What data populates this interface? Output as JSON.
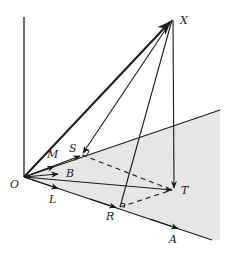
{
  "figure": {
    "colors": {
      "ink": "#1a1a1a",
      "plane_fill": "#e6e6e6",
      "background": "#ffffff"
    },
    "labels": {
      "X": "X",
      "O": "O",
      "M": "M",
      "S": "S",
      "B": "B",
      "L": "L",
      "T": "T",
      "R": "R",
      "A": "A"
    },
    "vectors": [
      {
        "name": "OX",
        "from": "O",
        "to": "X",
        "style": "bold-arrow"
      },
      {
        "name": "XS",
        "from": "X",
        "to": "S",
        "style": "arrow"
      },
      {
        "name": "XR",
        "from": "X",
        "to": "R",
        "style": "line"
      },
      {
        "name": "XT",
        "from": "X",
        "to": "T",
        "style": "arrow"
      },
      {
        "name": "OT",
        "from": "O",
        "to": "T",
        "style": "arrow"
      },
      {
        "name": "OM",
        "from": "O",
        "to": "M",
        "style": "arrow"
      },
      {
        "name": "OB",
        "from": "O",
        "to": "B",
        "style": "arrow"
      },
      {
        "name": "OL",
        "from": "O",
        "to": "L",
        "style": "arrow"
      },
      {
        "name": "OA",
        "from": "O",
        "to": "A",
        "style": "arrow"
      }
    ],
    "dashed_segments": [
      {
        "name": "ST",
        "from": "S",
        "to": "T"
      },
      {
        "name": "RT",
        "from": "R",
        "to": "T"
      }
    ],
    "right_angles": [
      "S",
      "R"
    ]
  }
}
